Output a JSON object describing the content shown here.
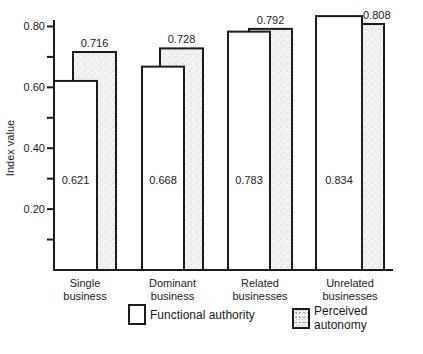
{
  "chart_data": {
    "type": "bar",
    "title": "",
    "xlabel": "",
    "ylabel": "Index value",
    "ylim": [
      0,
      0.84
    ],
    "yticks": [
      {
        "value": 0.8,
        "label": "0.80"
      },
      {
        "value": 0.7,
        "label": ""
      },
      {
        "value": 0.6,
        "label": "0.60"
      },
      {
        "value": 0.5,
        "label": ""
      },
      {
        "value": 0.4,
        "label": "0.40"
      },
      {
        "value": 0.3,
        "label": ""
      },
      {
        "value": 0.2,
        "label": "0.20"
      },
      {
        "value": 0.1,
        "label": ""
      }
    ],
    "categories": [
      [
        "Single",
        "business"
      ],
      [
        "Dominant",
        "business"
      ],
      [
        "Related",
        "businesses"
      ],
      [
        "Unrelated",
        "businesses"
      ]
    ],
    "series": [
      {
        "name": "Functional authority",
        "pattern": "plain",
        "values": [
          0.621,
          0.668,
          0.783,
          0.834
        ],
        "labels": [
          "0.621",
          "0.668",
          "0.783",
          "0.834"
        ]
      },
      {
        "name": "Perceived autonomy",
        "pattern": "stipple",
        "values": [
          0.716,
          0.728,
          0.792,
          0.808
        ],
        "labels": [
          "0.716",
          "0.728",
          "0.792",
          "0.808"
        ]
      }
    ],
    "legend_position": "bottom-right",
    "grid": false
  },
  "colors": {
    "ink": "#1a1a1a",
    "stipple_bg": "#f2f2f2",
    "stipple_dot": "#9a9a9a"
  }
}
